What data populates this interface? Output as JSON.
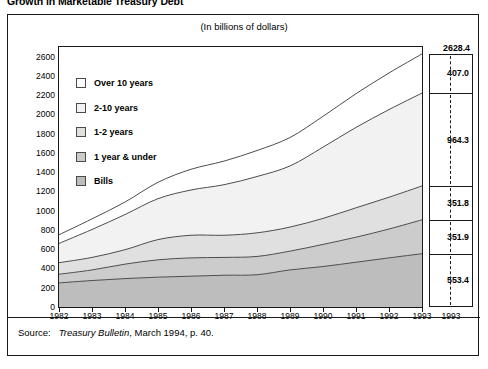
{
  "title": "Growth in Marketable Treasury Debt",
  "units_caption": "(In billions of dollars)",
  "source": {
    "label": "Source:",
    "publication": "Treasury Bulletin",
    "rest": ", March 1994, p. 40."
  },
  "legend": {
    "items": [
      {
        "label": "Over 10 years",
        "color": "#ffffff"
      },
      {
        "label": "2-10 years",
        "color": "#f2f2f2"
      },
      {
        "label": "1-2 years",
        "color": "#e0e0e0"
      },
      {
        "label": "1 year & under",
        "color": "#cccccc"
      },
      {
        "label": "Bills",
        "color": "#bdbdbd"
      }
    ]
  },
  "callout": {
    "year": "1993",
    "total": "2628.4",
    "segments": [
      {
        "label": "407.0"
      },
      {
        "label": "964.3"
      },
      {
        "label": "351.8"
      },
      {
        "label": "351.9"
      },
      {
        "label": "553.4"
      }
    ]
  },
  "chart_data": {
    "type": "area",
    "title": "Growth in Marketable Treasury Debt",
    "subtitle": "(In billions of dollars)",
    "xlabel": "",
    "ylabel": "",
    "stacked": true,
    "grid": false,
    "legend_position": "inside-top-left",
    "ylim": [
      0,
      2700
    ],
    "yticks": [
      0,
      200,
      400,
      600,
      800,
      1000,
      1200,
      1400,
      1600,
      1800,
      2000,
      2200,
      2400,
      2600
    ],
    "categories": [
      "1982",
      "1983",
      "1984",
      "1985",
      "1986",
      "1987",
      "1988",
      "1989",
      "1990",
      "1991",
      "1992",
      "1993"
    ],
    "series": [
      {
        "name": "Bills",
        "color": "#bdbdbd",
        "values": [
          250,
          275,
          295,
          310,
          320,
          330,
          335,
          385,
          420,
          465,
          510,
          553.4
        ]
      },
      {
        "name": "1 year & under",
        "color": "#cccccc",
        "values": [
          90,
          110,
          150,
          180,
          190,
          185,
          190,
          195,
          230,
          260,
          300,
          351.9
        ]
      },
      {
        "name": "1-2 years",
        "color": "#e0e0e0",
        "values": [
          120,
          130,
          150,
          210,
          235,
          230,
          245,
          250,
          270,
          305,
          330,
          351.8
        ]
      },
      {
        "name": "2-10 years",
        "color": "#f2f2f2",
        "values": [
          200,
          290,
          365,
          425,
          470,
          525,
          585,
          635,
          740,
          835,
          910,
          964.3
        ]
      },
      {
        "name": "Over 10 years",
        "color": "#ffffff",
        "values": [
          90,
          110,
          130,
          170,
          215,
          245,
          270,
          295,
          320,
          350,
          380,
          407.0
        ]
      }
    ],
    "cumulative_totals": [
      750,
      915,
      1090,
      1295,
      1430,
      1515,
      1625,
      1760,
      1980,
      2215,
      2430,
      2628.4
    ],
    "final_year_labels": {
      "1993": {
        "Over 10 years": 407.0,
        "2-10 years": 964.3,
        "1-2 years": 351.8,
        "1 year & under": 351.9,
        "Bills": 553.4,
        "total": 2628.4
      }
    }
  }
}
